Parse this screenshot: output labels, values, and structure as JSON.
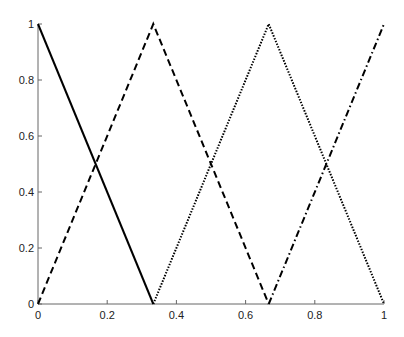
{
  "chart_data": {
    "type": "line",
    "title": "",
    "xlabel": "",
    "ylabel": "",
    "xlim": [
      0,
      1
    ],
    "ylim": [
      0,
      1
    ],
    "grid": false,
    "legend": null,
    "x_ticks": [
      "0",
      "0.2",
      "0.4",
      "0.6",
      "0.8",
      "1"
    ],
    "y_ticks": [
      "0",
      "0.2",
      "0.4",
      "0.6",
      "0.8",
      "1"
    ],
    "series": [
      {
        "name": "solid",
        "style": "solid",
        "x": [
          0,
          0.3333
        ],
        "y": [
          1,
          0
        ]
      },
      {
        "name": "dashed",
        "style": "dashed",
        "x": [
          0,
          0.3333,
          0.6667
        ],
        "y": [
          0,
          1,
          0
        ]
      },
      {
        "name": "dotted",
        "style": "dotted",
        "x": [
          0.3333,
          0.6667,
          1
        ],
        "y": [
          0,
          1,
          0
        ]
      },
      {
        "name": "dash-dot",
        "style": "dashdot",
        "x": [
          0.6667,
          1
        ],
        "y": [
          0,
          1
        ]
      }
    ]
  },
  "colors": {
    "axis": "#666666",
    "line": "#000000"
  }
}
